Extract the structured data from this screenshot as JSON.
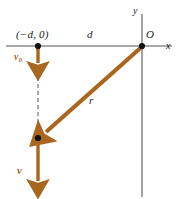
{
  "figure": {
    "name": "projectile-position-velocity-diagram",
    "background_color": "#ffffff",
    "width": 178,
    "height": 199,
    "colors": {
      "vector": "#a9661e",
      "axis": "#8c8c8c",
      "dashed": "#6e7b8b",
      "point": "#111111",
      "label": "#1a1a1a"
    },
    "labels": {
      "start_point_coordinates": "(−d, 0)",
      "horizontal_distance": "d",
      "origin": "O",
      "axis_x": "x",
      "axis_y": "y",
      "position_vector": "r",
      "initial_velocity": "v",
      "initial_velocity_subscript": "0",
      "final_velocity": "v"
    },
    "geometry": {
      "x_axis": {
        "x1": 6,
        "y1": 46,
        "x2": 172,
        "y2": 46
      },
      "y_axis": {
        "x1": 142,
        "y1": 14,
        "x2": 142,
        "y2": 197
      },
      "origin_point": {
        "x": 142,
        "y": 46
      },
      "start_point": {
        "x": 38,
        "y": 46
      },
      "lower_point": {
        "x": 38,
        "y": 139
      },
      "v0_arrow": {
        "x1": 38,
        "y1": 47,
        "x2": 38,
        "y2": 69
      },
      "dashed_segment": {
        "x1": 38,
        "y1": 70,
        "x2": 38,
        "y2": 133
      },
      "r_arrow": {
        "x1": 141,
        "y1": 47,
        "x2": 43,
        "y2": 134
      },
      "v_arrow": {
        "x1": 38,
        "y1": 141,
        "x2": 38,
        "y2": 193
      }
    }
  }
}
